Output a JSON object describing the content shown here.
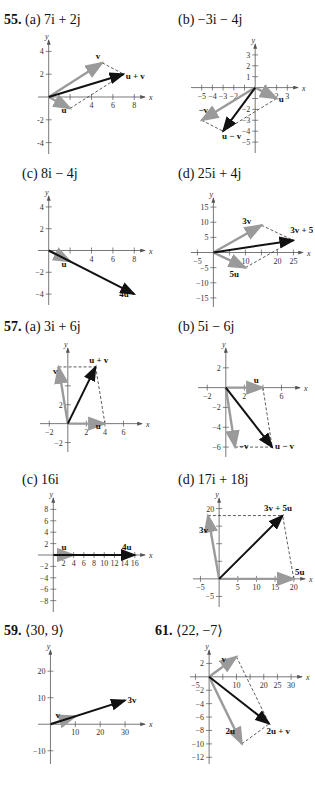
{
  "chart_data": [
    {
      "id": "p55a",
      "type": "line",
      "problem": "55.",
      "part": "(a)",
      "answer": "7i + 2j",
      "xlim": [
        -1,
        9
      ],
      "ylim": [
        -5,
        5
      ],
      "xticks": [
        2,
        4,
        6,
        8
      ],
      "xtick_labels": [
        "",
        "4",
        "6",
        "8"
      ],
      "yticks": [
        -4,
        -2,
        2,
        4
      ],
      "ytick_labels": [
        "-4",
        "-2",
        "2",
        "4"
      ],
      "xlabel": "x",
      "ylabel": "y",
      "vectors": [
        {
          "name": "v",
          "from": [
            0,
            0
          ],
          "to": [
            5,
            3
          ],
          "style": "gray",
          "label": "v",
          "label_at": [
            4.4,
            3.3
          ]
        },
        {
          "name": "u",
          "from": [
            0,
            0
          ],
          "to": [
            2,
            -1
          ],
          "style": "gray",
          "label": "u",
          "label_at": [
            1.2,
            -1.4
          ]
        },
        {
          "name": "u+v",
          "from": [
            0,
            0
          ],
          "to": [
            7,
            2
          ],
          "style": "black",
          "label": "u + v",
          "label_at": [
            7.2,
            1.6
          ]
        }
      ],
      "dashed": [
        [
          [
            5,
            3
          ],
          [
            7,
            2
          ]
        ],
        [
          [
            2,
            -1
          ],
          [
            7,
            2
          ]
        ]
      ]
    },
    {
      "id": "p55b",
      "type": "line",
      "problem": "",
      "part": "(b)",
      "answer": "−3i − 4j",
      "xlim": [
        -6,
        4
      ],
      "ylim": [
        -6,
        4
      ],
      "xticks": [
        -5,
        -4,
        -3,
        -2,
        -1,
        1,
        2,
        3
      ],
      "xtick_labels": [
        "−5",
        "−4",
        "−3",
        "−2",
        "",
        "",
        "2",
        "3"
      ],
      "yticks": [
        -5,
        -4,
        -3,
        -2,
        -1,
        1,
        2,
        3
      ],
      "ytick_labels": [
        "−5",
        "−4",
        "−3",
        "−2",
        "",
        "1",
        "2",
        "3"
      ],
      "xlabel": "x",
      "ylabel": "y",
      "vectors": [
        {
          "name": "u",
          "from": [
            0,
            0
          ],
          "to": [
            2,
            -1
          ],
          "style": "gray",
          "label": "u",
          "label_at": [
            2.2,
            -1.3
          ]
        },
        {
          "name": "-v",
          "from": [
            0,
            0
          ],
          "to": [
            -5,
            -3
          ],
          "style": "gray",
          "label": "−v",
          "label_at": [
            -5.3,
            -2.3
          ]
        },
        {
          "name": "u-v",
          "from": [
            0,
            0
          ],
          "to": [
            -3,
            -4
          ],
          "style": "black",
          "label": "u − v",
          "label_at": [
            -3.1,
            -4.7
          ]
        }
      ],
      "dashed": [
        [
          [
            2,
            -1
          ],
          [
            -3,
            -4
          ]
        ],
        [
          [
            -5,
            -3
          ],
          [
            -3,
            -4
          ]
        ]
      ]
    },
    {
      "id": "p55c",
      "type": "line",
      "problem": "",
      "part": "(c)",
      "answer": "8i − 4j",
      "xlim": [
        -1,
        9
      ],
      "ylim": [
        -5,
        5
      ],
      "xticks": [
        2,
        4,
        6,
        8
      ],
      "xtick_labels": [
        "",
        "4",
        "6",
        "8"
      ],
      "yticks": [
        -4,
        -2,
        2,
        4
      ],
      "ytick_labels": [
        "−4",
        "−2",
        "2",
        "4"
      ],
      "xlabel": "x",
      "ylabel": "y",
      "vectors": [
        {
          "name": "4u",
          "from": [
            0,
            0
          ],
          "to": [
            8,
            -4
          ],
          "style": "black",
          "label": "4u",
          "label_at": [
            6.6,
            -4.3
          ]
        },
        {
          "name": "u",
          "from": [
            0,
            0
          ],
          "to": [
            2,
            -1
          ],
          "style": "gray",
          "label": "u",
          "label_at": [
            1.2,
            -1.5
          ]
        }
      ],
      "dashed": []
    },
    {
      "id": "p55d",
      "type": "line",
      "problem": "",
      "part": "(d)",
      "answer": "25i + 4j",
      "xlim": [
        -7,
        28
      ],
      "ylim": [
        -18,
        18
      ],
      "xticks": [
        -5,
        5,
        10,
        15,
        20,
        25
      ],
      "xtick_labels": [
        "−5",
        "",
        "10",
        "",
        "20",
        "25"
      ],
      "yticks": [
        -15,
        -10,
        -5,
        5,
        10,
        15
      ],
      "ytick_labels": [
        "−15",
        "−10",
        "−5",
        "5",
        "10",
        "15"
      ],
      "xlabel": "x",
      "ylabel": "y",
      "vectors": [
        {
          "name": "3v",
          "from": [
            0,
            0
          ],
          "to": [
            15,
            9
          ],
          "style": "gray",
          "label": "3v",
          "label_at": [
            9,
            9.5
          ]
        },
        {
          "name": "5u",
          "from": [
            0,
            0
          ],
          "to": [
            10,
            -5
          ],
          "style": "gray",
          "label": "5u",
          "label_at": [
            5,
            -8
          ]
        },
        {
          "name": "3v+5u",
          "from": [
            0,
            0
          ],
          "to": [
            25,
            4
          ],
          "style": "black",
          "label": "3v + 5u",
          "label_at": [
            24,
            6.5
          ]
        }
      ],
      "dashed": [
        [
          [
            15,
            9
          ],
          [
            25,
            4
          ]
        ],
        [
          [
            10,
            -5
          ],
          [
            25,
            4
          ]
        ]
      ]
    },
    {
      "id": "p57a",
      "type": "line",
      "problem": "57.",
      "part": "(a)",
      "answer": "3i + 6j",
      "xlim": [
        -3,
        8
      ],
      "ylim": [
        -3,
        8
      ],
      "xticks": [
        -2,
        2,
        4,
        6
      ],
      "xtick_labels": [
        "−2",
        "2",
        "4",
        "6"
      ],
      "yticks": [
        -2,
        2,
        4
      ],
      "ytick_labels": [
        "−2",
        "2",
        ""
      ],
      "xlabel": "x",
      "ylabel": "y",
      "vectors": [
        {
          "name": "v",
          "from": [
            0,
            0
          ],
          "to": [
            -1,
            6
          ],
          "style": "gray",
          "label": "v",
          "label_at": [
            -1.6,
            5.3
          ]
        },
        {
          "name": "u",
          "from": [
            0,
            0
          ],
          "to": [
            4,
            0
          ],
          "style": "gray",
          "label": "u",
          "label_at": [
            3.0,
            -0.6
          ]
        },
        {
          "name": "u+v",
          "from": [
            0,
            0
          ],
          "to": [
            3,
            6
          ],
          "style": "black",
          "label": "u + v",
          "label_at": [
            2.3,
            6.4
          ]
        }
      ],
      "dashed": [
        [
          [
            -1,
            6
          ],
          [
            3,
            6
          ]
        ],
        [
          [
            4,
            0
          ],
          [
            3,
            6
          ]
        ]
      ]
    },
    {
      "id": "p57b",
      "type": "line",
      "problem": "",
      "part": "(b)",
      "answer": "5i − 6j",
      "xlim": [
        -3,
        8
      ],
      "ylim": [
        -7,
        4
      ],
      "xticks": [
        -2,
        2,
        4,
        6
      ],
      "xtick_labels": [
        "−2",
        "2",
        "",
        "6"
      ],
      "yticks": [
        -6,
        -4,
        -2,
        2
      ],
      "ytick_labels": [
        "−6",
        "−4",
        "−2",
        "2"
      ],
      "xlabel": "x",
      "ylabel": "y",
      "vectors": [
        {
          "name": "u",
          "from": [
            0,
            0
          ],
          "to": [
            4,
            0
          ],
          "style": "gray",
          "label": "u",
          "label_at": [
            3.0,
            0.5
          ]
        },
        {
          "name": "-v",
          "from": [
            0,
            0
          ],
          "to": [
            1,
            -6
          ],
          "style": "gray",
          "label": "−v",
          "label_at": [
            1.4,
            -6.2
          ]
        },
        {
          "name": "u-v",
          "from": [
            0,
            0
          ],
          "to": [
            5,
            -6
          ],
          "style": "black",
          "label": "u − v",
          "label_at": [
            5.3,
            -6.2
          ]
        }
      ],
      "dashed": [
        [
          [
            4,
            0
          ],
          [
            5,
            -6
          ]
        ],
        [
          [
            1,
            -6
          ],
          [
            5,
            -6
          ]
        ]
      ]
    },
    {
      "id": "p57c",
      "type": "line",
      "problem": "",
      "part": "(c)",
      "answer": "16i",
      "xlim": [
        -3,
        18
      ],
      "ylim": [
        -10,
        10
      ],
      "xticks": [
        2,
        4,
        6,
        8,
        10,
        12,
        14,
        16
      ],
      "xtick_labels": [
        "2",
        "4",
        "6",
        "8",
        "10",
        "12",
        "14",
        "16"
      ],
      "yticks": [
        -8,
        -6,
        -4,
        -2,
        2,
        4,
        6,
        8
      ],
      "ytick_labels": [
        "−8",
        "−6",
        "−4",
        "−2",
        "2",
        "4",
        "6",
        "8"
      ],
      "xlabel": "x",
      "ylabel": "y",
      "vectors": [
        {
          "name": "4u",
          "from": [
            0,
            0
          ],
          "to": [
            16,
            0
          ],
          "style": "black",
          "label": "4u",
          "label_at": [
            13.5,
            0.9
          ]
        },
        {
          "name": "u",
          "from": [
            0,
            0
          ],
          "to": [
            4,
            0
          ],
          "style": "gray",
          "label": "u",
          "label_at": [
            1.6,
            0.9
          ]
        }
      ],
      "dashed": []
    },
    {
      "id": "p57d",
      "type": "line",
      "problem": "",
      "part": "(d)",
      "answer": "17i + 18j",
      "xlim": [
        -7,
        23
      ],
      "ylim": [
        -8,
        23
      ],
      "xticks": [
        -5,
        5,
        10,
        15,
        20
      ],
      "xtick_labels": [
        "−5",
        "5",
        "10",
        "15",
        "20"
      ],
      "yticks": [
        -5,
        5,
        10,
        15,
        20
      ],
      "ytick_labels": [
        "−5",
        "",
        "",
        "",
        "20"
      ],
      "xlabel": "x",
      "ylabel": "y",
      "vectors": [
        {
          "name": "5u",
          "from": [
            0,
            0
          ],
          "to": [
            20,
            0
          ],
          "style": "gray",
          "label": "5u",
          "label_at": [
            20.3,
            1.2
          ]
        },
        {
          "name": "3v",
          "from": [
            0,
            0
          ],
          "to": [
            -3,
            18
          ],
          "style": "gray",
          "label": "3v",
          "label_at": [
            -5.4,
            13
          ]
        },
        {
          "name": "3v+5u",
          "from": [
            0,
            0
          ],
          "to": [
            17,
            18
          ],
          "style": "black",
          "label": "3v + 5u",
          "label_at": [
            12,
            19.3
          ]
        }
      ],
      "dashed": [
        [
          [
            -3,
            18
          ],
          [
            17,
            18
          ]
        ],
        [
          [
            20,
            0
          ],
          [
            17,
            18
          ]
        ]
      ]
    },
    {
      "id": "p59",
      "type": "line",
      "problem": "59.",
      "part": "",
      "answer": "⟨30, 9⟩",
      "xlim": [
        -5,
        38
      ],
      "ylim": [
        -15,
        28
      ],
      "xticks": [
        10,
        20,
        30
      ],
      "xtick_labels": [
        "10",
        "20",
        "30"
      ],
      "yticks": [
        -10,
        10,
        20
      ],
      "ytick_labels": [
        "−10",
        "10",
        "20"
      ],
      "xlabel": "x",
      "ylabel": "y",
      "vectors": [
        {
          "name": "3v",
          "from": [
            0,
            0
          ],
          "to": [
            30,
            9
          ],
          "style": "black",
          "label": "3v",
          "label_at": [
            31,
            8
          ]
        },
        {
          "name": "v",
          "from": [
            0,
            0
          ],
          "to": [
            10,
            3
          ],
          "style": "gray",
          "label": "v",
          "label_at": [
            2,
            2.5
          ]
        }
      ],
      "dashed": []
    },
    {
      "id": "p61",
      "type": "line",
      "problem": "61.",
      "part": "",
      "answer": "⟨22, −7⟩",
      "xlim": [
        -7,
        34
      ],
      "ylim": [
        -13,
        4
      ],
      "xticks": [
        -5,
        5,
        10,
        15,
        20,
        25,
        30
      ],
      "xtick_labels": [
        "−5",
        "",
        "10",
        "",
        "20",
        "25",
        "30"
      ],
      "yticks": [
        -12,
        -10,
        -8,
        -6,
        -4,
        -2,
        2
      ],
      "ytick_labels": [
        "−12",
        "−10",
        "−8",
        "−6",
        "−4",
        "−2",
        "2"
      ],
      "xlabel": "x",
      "ylabel": "y",
      "vectors": [
        {
          "name": "v",
          "from": [
            0,
            0
          ],
          "to": [
            10,
            3
          ],
          "style": "gray",
          "label": "v",
          "label_at": [
            4.5,
            2.2
          ]
        },
        {
          "name": "2u",
          "from": [
            0,
            0
          ],
          "to": [
            12,
            -10
          ],
          "style": "gray",
          "label": "2u",
          "label_at": [
            6,
            -8.6
          ]
        },
        {
          "name": "2u+v",
          "from": [
            0,
            0
          ],
          "to": [
            22,
            -7
          ],
          "style": "black",
          "label": "2u + v",
          "label_at": [
            21,
            -8.6
          ]
        }
      ],
      "dashed": [
        [
          [
            10,
            3
          ],
          [
            22,
            -7
          ]
        ],
        [
          [
            12,
            -10
          ],
          [
            22,
            -7
          ]
        ]
      ]
    }
  ]
}
